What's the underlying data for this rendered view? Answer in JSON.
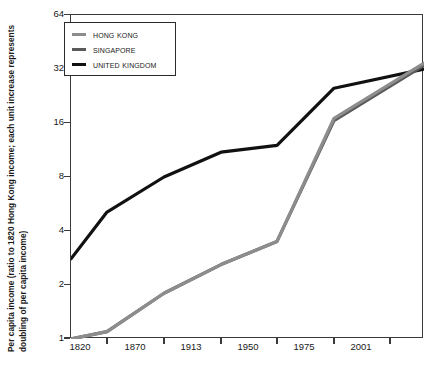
{
  "chart_data": {
    "type": "line",
    "title": "",
    "xlabel": "",
    "ylabel": "Per capita income (ratio to 1820 Hong Kong income; each unit increase represents doubling of per capita income)",
    "x": [
      1820,
      1870,
      1913,
      1950,
      1975,
      2001,
      2015
    ],
    "xtick_labels": [
      "1820",
      "1870",
      "1913",
      "1950",
      "1975",
      "2001",
      ""
    ],
    "ytick_labels": [
      "1",
      "2",
      "4",
      "8",
      "16",
      "32",
      "64"
    ],
    "ytick_values": [
      1,
      2,
      4,
      8,
      16,
      32,
      64
    ],
    "ylim": [
      1,
      64
    ],
    "yscale": "log2",
    "grid": false,
    "legend_position": "top-left",
    "series": [
      {
        "name": "Hong Kong",
        "color": "#8d8d8d",
        "values": [
          1.0,
          1.1,
          1.8,
          2.6,
          3.5,
          17.0,
          34.5
        ]
      },
      {
        "name": "Singapore",
        "color": "#5a5a5a",
        "values": [
          1.0,
          1.1,
          1.8,
          2.6,
          3.5,
          16.5,
          33.5
        ]
      },
      {
        "name": "United Kingdom",
        "color": "#111111",
        "values": [
          2.8,
          5.1,
          8.0,
          11.0,
          12.0,
          25.0,
          32.0
        ]
      }
    ]
  },
  "legend": {
    "items": [
      {
        "label": "Hong Kong",
        "color": "#8d8d8d"
      },
      {
        "label": "Singapore",
        "color": "#5a5a5a"
      },
      {
        "label": "United Kingdom",
        "color": "#111111"
      }
    ]
  },
  "axes": {
    "y_title": "Per capita income (ratio to 1820 Hong Kong income; each unit increase represents doubling of per capita income)",
    "y_ticks": [
      "64",
      "32",
      "16",
      "8",
      "4",
      "2",
      "1"
    ],
    "x_ticks": [
      "1820",
      "1870",
      "1913",
      "1950",
      "1975",
      "2001"
    ]
  },
  "colors": {
    "axis": "#3a3a3a",
    "text": "#1a1a1a",
    "background": "#ffffff"
  }
}
